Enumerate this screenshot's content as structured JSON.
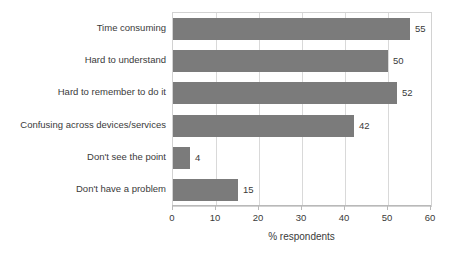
{
  "chart_data": {
    "type": "bar",
    "orientation": "horizontal",
    "title": "",
    "xlabel": "% respondents",
    "ylabel": "",
    "xlim": [
      0,
      60
    ],
    "xticks": [
      0,
      10,
      20,
      30,
      40,
      50,
      60
    ],
    "xtick_labels": [
      "0",
      "10",
      "20",
      "30",
      "40",
      "50",
      "60"
    ],
    "grid": true,
    "legend": false,
    "categories": [
      "Time consuming",
      "Hard to understand",
      "Hard to remember to do it",
      "Confusing across devices/services",
      "Don't see the point",
      "Don't have a problem"
    ],
    "values": [
      55,
      50,
      52,
      42,
      4,
      15
    ],
    "value_labels": [
      "55",
      "50",
      "52",
      "42",
      "4",
      "15"
    ],
    "bar_color": "#7b7b7b",
    "grid_color": "#d9d9d9",
    "axis_color": "#b9b9b9",
    "text_color": "#3a3a3a",
    "background": "#ffffff"
  }
}
